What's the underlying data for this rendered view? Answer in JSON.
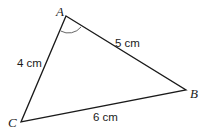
{
  "diagram": {
    "type": "triangle",
    "vertices": {
      "A": {
        "label": "A",
        "x": 66,
        "y": 16
      },
      "B": {
        "label": "B",
        "x": 186,
        "y": 90
      },
      "C": {
        "label": "C",
        "x": 21,
        "y": 122
      }
    },
    "sides": {
      "AB": {
        "label": "5 cm"
      },
      "AC": {
        "label": "4 cm"
      },
      "BC": {
        "label": "6 cm"
      }
    },
    "angle_marker": {
      "vertex": "A"
    },
    "colors": {
      "line": "#1a1a1a",
      "background": "#ffffff"
    }
  }
}
